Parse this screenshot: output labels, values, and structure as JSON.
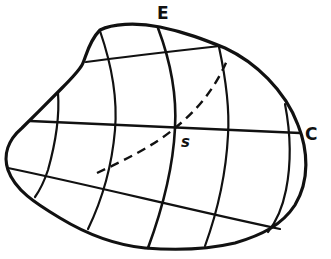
{
  "diagram": {
    "labels": {
      "top": "E",
      "right": "C",
      "center_point": "s"
    },
    "elements": {
      "outline": "closed irregular boundary curve",
      "horizontal_curves": 3,
      "vertical_curves": 5,
      "dashed_curve": "diagonal dashed curve through s from lower-left to upper-right"
    },
    "colors": {
      "stroke": "#111111",
      "background": "#ffffff"
    }
  }
}
